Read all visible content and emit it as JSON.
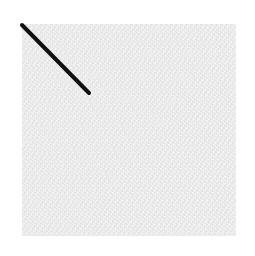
{
  "figure": {
    "background_color": "#ffffff",
    "panel": {
      "fill_color": "#eeeeee",
      "texture": "noise",
      "x": 22,
      "y": 24,
      "width": 214,
      "height": 212
    },
    "line": {
      "color": "#111111",
      "stroke_width": 4,
      "x1": 22,
      "y1": 25,
      "x2": 89,
      "y2": 93
    }
  }
}
